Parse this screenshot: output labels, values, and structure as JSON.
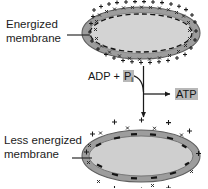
{
  "figure": {
    "background_color": "#ffffff",
    "width": 208,
    "height": 188
  },
  "labels": {
    "energized": {
      "line1": "Energized",
      "line2": "membrane"
    },
    "less_energized": {
      "line1": "Less energized",
      "line2": "membrane"
    }
  },
  "reaction": {
    "substrate_prefix": "ADP + ",
    "substrate_phosphate": "P",
    "substrate_phosphate_subscript": "i",
    "product": "ATP",
    "highlight_color": "#b8b8b8"
  },
  "diagram": {
    "top_cell": {
      "name": "energized-membrane-cell",
      "outer_charge_symbol": "+",
      "outer_charge_count": 28,
      "inner_charge_symbol": "x",
      "inner_charge_count": 26,
      "interior_boundary": "dashed",
      "membrane_fill": "#9d9d9d",
      "interior_fill": "#d3d3d3"
    },
    "bottom_cell": {
      "name": "less-energized-membrane-cell",
      "outer_charge_symbol": "+",
      "outer_charge_count": 10,
      "inner_charge_symbol": "x",
      "inner_charge_count": 8,
      "membrane_dash_symbol": "-",
      "membrane_dash_count": 12,
      "membrane_fill": "#9d9d9d",
      "interior_fill": "#cfcfcf"
    },
    "arrows": {
      "vertical": "down-arrow-energy-flow",
      "curved": "curved-substrate-arrow",
      "horizontal": "product-arrow"
    },
    "leader_lines": 2
  }
}
